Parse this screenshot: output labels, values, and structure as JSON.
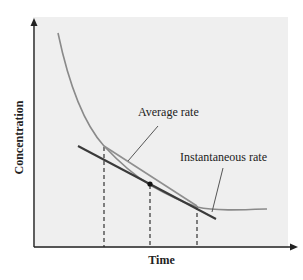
{
  "diagram": {
    "title": "",
    "axes": {
      "x_label": "Time",
      "y_label": "Concentration"
    },
    "annotations": {
      "average_rate": "Average rate",
      "instantaneous_rate": "Instantaneous rate"
    },
    "elements": [
      {
        "type": "curve",
        "description": "Concentration decaying over time (exponential-like decrease)"
      },
      {
        "type": "secant-line",
        "description": "Average rate between two time points"
      },
      {
        "type": "tangent-line",
        "description": "Instantaneous rate at midpoint"
      },
      {
        "type": "point",
        "description": "Tangent point on curve"
      },
      {
        "type": "dashed-guides",
        "count": 3
      }
    ],
    "colors": {
      "background": "#ffffff",
      "plot_background": "#efefef",
      "axis": "#222222",
      "curve": "#8a8a8a",
      "tangent": "#3a3a3a",
      "secant": "#8f8f8f",
      "point": "#111111"
    }
  }
}
